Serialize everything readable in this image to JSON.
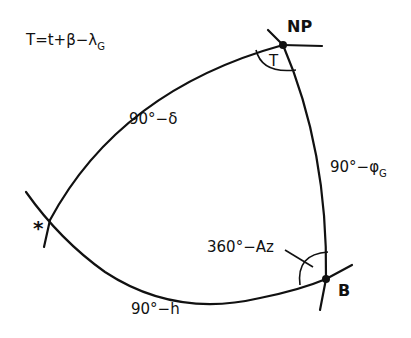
{
  "diagram": {
    "formula": {
      "main": "T=t+β−λ",
      "subscript": "G"
    },
    "vertices": [
      {
        "id": "pole",
        "label": "NP"
      },
      {
        "id": "observer",
        "label": "B"
      },
      {
        "id": "star",
        "label": "*"
      }
    ],
    "angles": [
      {
        "at": "pole",
        "label": "T"
      },
      {
        "at": "observer",
        "label": "360°−Az"
      }
    ],
    "sides": [
      {
        "between": [
          "pole",
          "star"
        ],
        "label": "90°−δ"
      },
      {
        "between": [
          "pole",
          "observer"
        ],
        "label_main": "90°−φ",
        "label_sub": "G"
      },
      {
        "between": [
          "star",
          "observer"
        ],
        "label": "90°−h"
      }
    ],
    "stroke_color": "#111111",
    "background": "#ffffff"
  }
}
